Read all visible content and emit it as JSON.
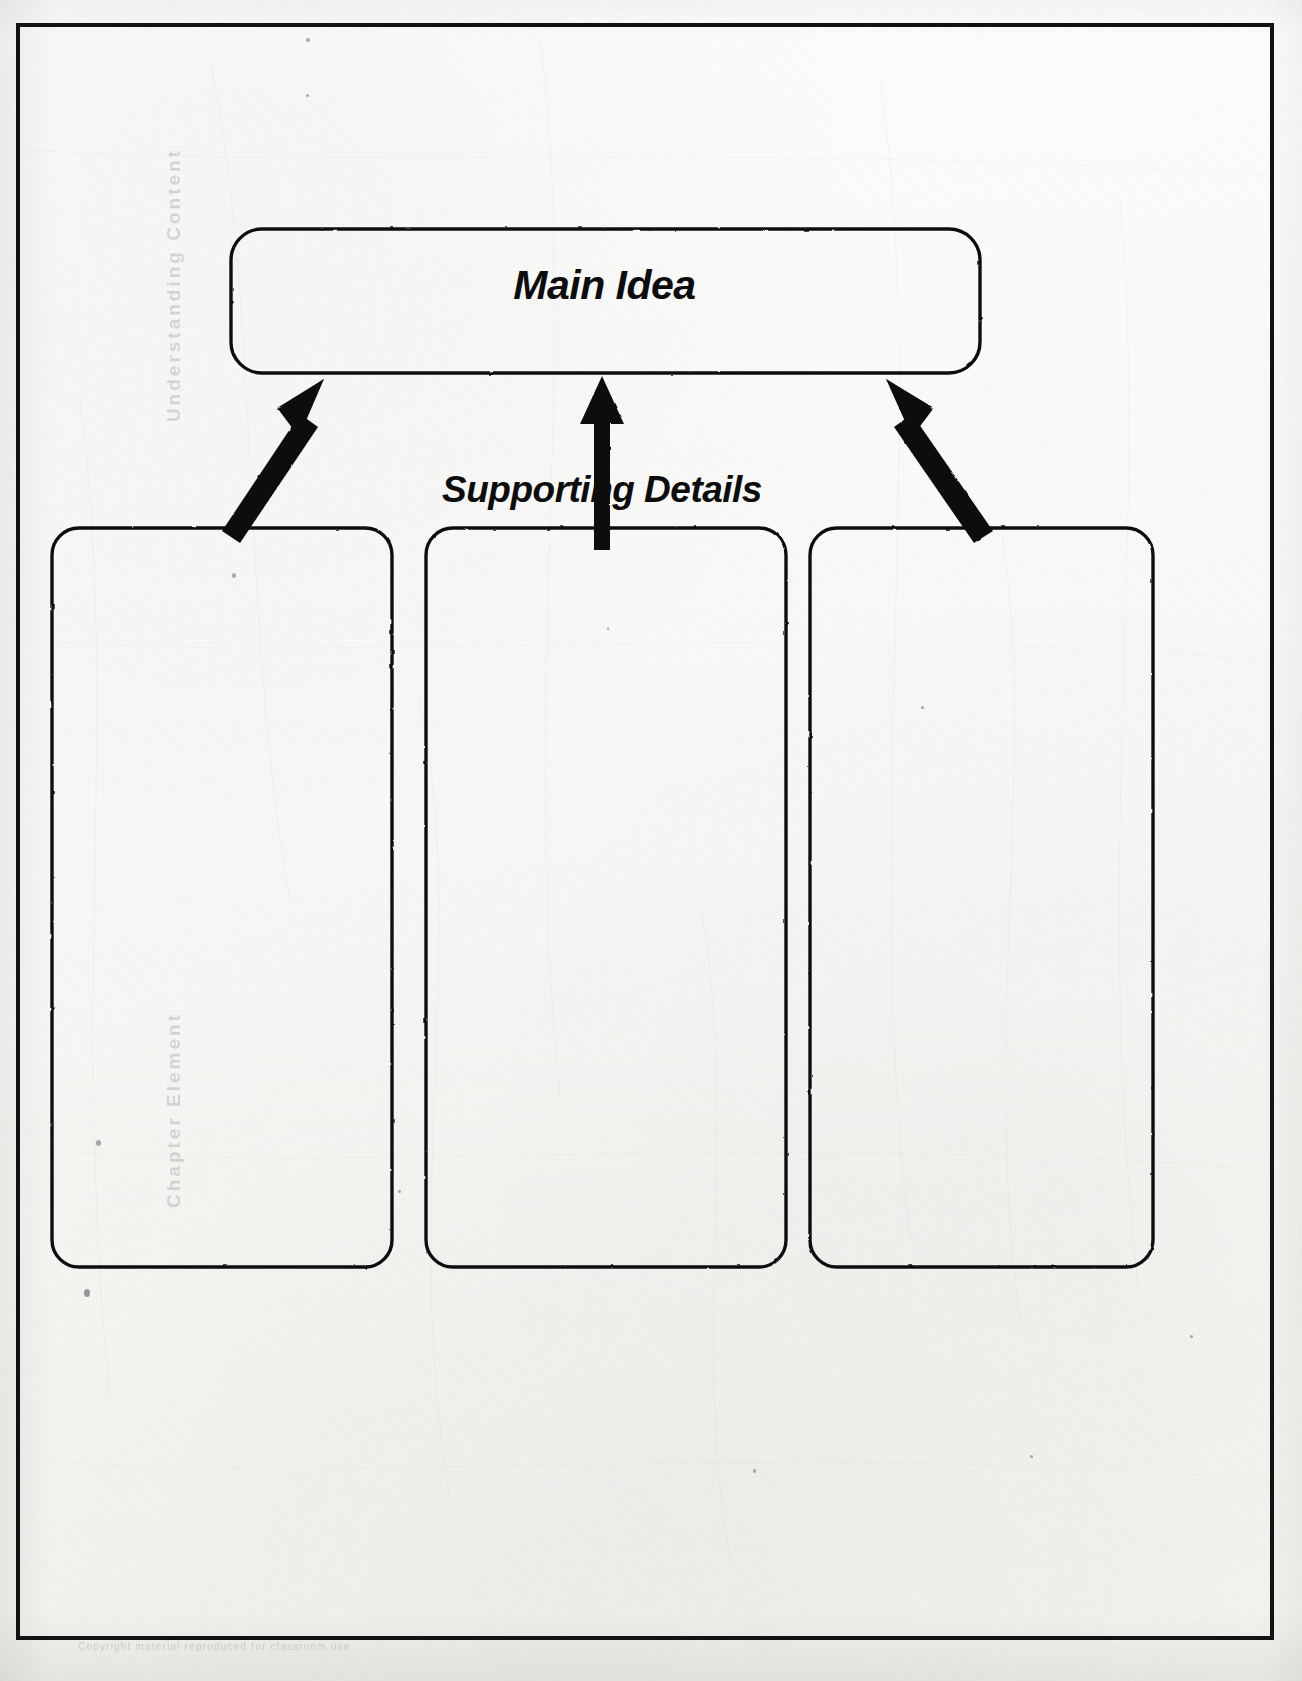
{
  "document": {
    "type": "graphic-organizer-worksheet",
    "title": "Main Idea and Supporting Details Organizer"
  },
  "frame": {
    "border_color": "#121212"
  },
  "organizer": {
    "main_idea": {
      "label": "Main Idea",
      "box_name": "main-idea-box"
    },
    "supporting_details": {
      "label": "Supporting Details",
      "boxes": [
        {
          "label": "",
          "name": "supporting-detail-box-1"
        },
        {
          "label": "",
          "name": "supporting-detail-box-2"
        },
        {
          "label": "",
          "name": "supporting-detail-box-3"
        }
      ]
    },
    "arrows": [
      {
        "name": "arrow-left",
        "direction": "up-right"
      },
      {
        "name": "arrow-center",
        "direction": "up"
      },
      {
        "name": "arrow-right",
        "direction": "up-left"
      }
    ]
  },
  "artifacts": {
    "bleed_text_top": "Understanding Content",
    "bleed_text_bottom": "Chapter Element",
    "bleed_text_footer": "Copyright material reproduced for classroom use"
  },
  "colors": {
    "ink": "#0d0d0d",
    "paper": "#fbfbf9",
    "border": "#121212"
  }
}
